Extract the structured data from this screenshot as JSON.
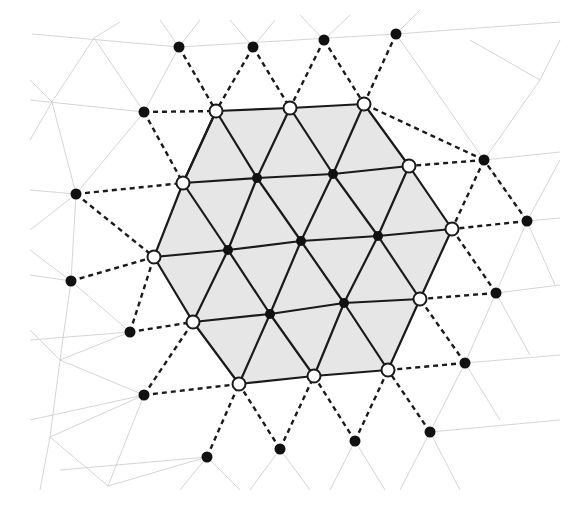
{
  "diagram": {
    "colors": {
      "background": "#ffffff",
      "patch_fill": "#e6e6e6",
      "edge": "#1a1a1a",
      "grid": "#d0d0d0"
    },
    "interior_nodes": [
      [
        257,
        178
      ],
      [
        333,
        174
      ],
      [
        228,
        250
      ],
      [
        301,
        241
      ],
      [
        378,
        236
      ],
      [
        270,
        314
      ],
      [
        344,
        303
      ]
    ],
    "boundary_nodes": [
      [
        216,
        111
      ],
      [
        290,
        108
      ],
      [
        364,
        104
      ],
      [
        409,
        166
      ],
      [
        452,
        229
      ],
      [
        420,
        299
      ],
      [
        388,
        370
      ],
      [
        314,
        376
      ],
      [
        239,
        384
      ],
      [
        193,
        322
      ],
      [
        154,
        257
      ],
      [
        183,
        183
      ]
    ],
    "outer_nodes": [
      [
        179,
        47
      ],
      [
        253,
        47
      ],
      [
        324,
        40
      ],
      [
        396,
        34
      ],
      [
        484,
        160
      ],
      [
        527,
        221
      ],
      [
        496,
        293
      ],
      [
        465,
        363
      ],
      [
        430,
        432
      ],
      [
        355,
        441
      ],
      [
        280,
        449
      ],
      [
        207,
        457
      ],
      [
        144,
        395
      ],
      [
        130,
        332
      ],
      [
        71,
        281
      ],
      [
        76,
        194
      ],
      [
        144,
        112
      ]
    ],
    "solid_edges": [
      [
        [
          216,
          111
        ],
        [
          290,
          108
        ]
      ],
      [
        [
          290,
          108
        ],
        [
          364,
          104
        ]
      ],
      [
        [
          364,
          104
        ],
        [
          409,
          166
        ]
      ],
      [
        [
          409,
          166
        ],
        [
          452,
          229
        ]
      ],
      [
        [
          452,
          229
        ],
        [
          420,
          299
        ]
      ],
      [
        [
          420,
          299
        ],
        [
          388,
          370
        ]
      ],
      [
        [
          388,
          370
        ],
        [
          314,
          376
        ]
      ],
      [
        [
          314,
          376
        ],
        [
          239,
          384
        ]
      ],
      [
        [
          239,
          384
        ],
        [
          193,
          322
        ]
      ],
      [
        [
          193,
          322
        ],
        [
          154,
          257
        ]
      ],
      [
        [
          154,
          257
        ],
        [
          183,
          183
        ]
      ],
      [
        [
          183,
          183
        ],
        [
          216,
          111
        ]
      ],
      [
        [
          183,
          183
        ],
        [
          257,
          178
        ]
      ],
      [
        [
          257,
          178
        ],
        [
          333,
          174
        ]
      ],
      [
        [
          333,
          174
        ],
        [
          409,
          166
        ]
      ],
      [
        [
          154,
          257
        ],
        [
          228,
          250
        ]
      ],
      [
        [
          228,
          250
        ],
        [
          301,
          241
        ]
      ],
      [
        [
          301,
          241
        ],
        [
          378,
          236
        ]
      ],
      [
        [
          378,
          236
        ],
        [
          452,
          229
        ]
      ],
      [
        [
          193,
          322
        ],
        [
          270,
          314
        ]
      ],
      [
        [
          270,
          314
        ],
        [
          344,
          303
        ]
      ],
      [
        [
          344,
          303
        ],
        [
          420,
          299
        ]
      ],
      [
        [
          216,
          111
        ],
        [
          257,
          178
        ]
      ],
      [
        [
          257,
          178
        ],
        [
          301,
          241
        ]
      ],
      [
        [
          301,
          241
        ],
        [
          344,
          303
        ]
      ],
      [
        [
          344,
          303
        ],
        [
          388,
          370
        ]
      ],
      [
        [
          183,
          183
        ],
        [
          228,
          250
        ]
      ],
      [
        [
          228,
          250
        ],
        [
          270,
          314
        ]
      ],
      [
        [
          270,
          314
        ],
        [
          314,
          376
        ]
      ],
      [
        [
          290,
          108
        ],
        [
          333,
          174
        ]
      ],
      [
        [
          333,
          174
        ],
        [
          378,
          236
        ]
      ],
      [
        [
          378,
          236
        ],
        [
          420,
          299
        ]
      ],
      [
        [
          290,
          108
        ],
        [
          257,
          178
        ]
      ],
      [
        [
          257,
          178
        ],
        [
          228,
          250
        ]
      ],
      [
        [
          228,
          250
        ],
        [
          193,
          322
        ]
      ],
      [
        [
          364,
          104
        ],
        [
          333,
          174
        ]
      ],
      [
        [
          333,
          174
        ],
        [
          301,
          241
        ]
      ],
      [
        [
          301,
          241
        ],
        [
          270,
          314
        ]
      ],
      [
        [
          270,
          314
        ],
        [
          239,
          384
        ]
      ],
      [
        [
          409,
          166
        ],
        [
          378,
          236
        ]
      ],
      [
        [
          378,
          236
        ],
        [
          344,
          303
        ]
      ],
      [
        [
          344,
          303
        ],
        [
          314,
          376
        ]
      ],
      [
        [
          216,
          111
        ],
        [
          183,
          183
        ]
      ]
    ],
    "dashed_edges": [
      [
        [
          179,
          47
        ],
        [
          216,
          111
        ]
      ],
      [
        [
          253,
          47
        ],
        [
          216,
          111
        ]
      ],
      [
        [
          253,
          47
        ],
        [
          290,
          108
        ]
      ],
      [
        [
          324,
          40
        ],
        [
          290,
          108
        ]
      ],
      [
        [
          324,
          40
        ],
        [
          364,
          104
        ]
      ],
      [
        [
          396,
          34
        ],
        [
          364,
          104
        ]
      ],
      [
        [
          144,
          112
        ],
        [
          216,
          111
        ]
      ],
      [
        [
          144,
          112
        ],
        [
          183,
          183
        ]
      ],
      [
        [
          76,
          194
        ],
        [
          183,
          183
        ]
      ],
      [
        [
          76,
          194
        ],
        [
          154,
          257
        ]
      ],
      [
        [
          71,
          281
        ],
        [
          154,
          257
        ]
      ],
      [
        [
          130,
          332
        ],
        [
          154,
          257
        ]
      ],
      [
        [
          130,
          332
        ],
        [
          193,
          322
        ]
      ],
      [
        [
          144,
          395
        ],
        [
          193,
          322
        ]
      ],
      [
        [
          144,
          395
        ],
        [
          239,
          384
        ]
      ],
      [
        [
          207,
          457
        ],
        [
          239,
          384
        ]
      ],
      [
        [
          280,
          449
        ],
        [
          239,
          384
        ]
      ],
      [
        [
          280,
          449
        ],
        [
          314,
          376
        ]
      ],
      [
        [
          355,
          441
        ],
        [
          314,
          376
        ]
      ],
      [
        [
          355,
          441
        ],
        [
          388,
          370
        ]
      ],
      [
        [
          430,
          432
        ],
        [
          388,
          370
        ]
      ],
      [
        [
          465,
          363
        ],
        [
          388,
          370
        ]
      ],
      [
        [
          465,
          363
        ],
        [
          420,
          299
        ]
      ],
      [
        [
          496,
          293
        ],
        [
          420,
          299
        ]
      ],
      [
        [
          496,
          293
        ],
        [
          452,
          229
        ]
      ],
      [
        [
          527,
          221
        ],
        [
          452,
          229
        ]
      ],
      [
        [
          484,
          160
        ],
        [
          452,
          229
        ]
      ],
      [
        [
          484,
          160
        ],
        [
          409,
          166
        ]
      ],
      [
        [
          484,
          160
        ],
        [
          364,
          104
        ]
      ],
      [
        [
          527,
          221
        ],
        [
          484,
          160
        ]
      ]
    ],
    "grid_lines": [
      [
        [
          32,
          34
        ],
        [
          179,
          47
        ]
      ],
      [
        [
          179,
          47
        ],
        [
          396,
          34
        ]
      ],
      [
        [
          396,
          34
        ],
        [
          560,
          22
        ]
      ],
      [
        [
          30,
          100
        ],
        [
          144,
          112
        ]
      ],
      [
        [
          484,
          160
        ],
        [
          560,
          152
        ]
      ],
      [
        [
          527,
          221
        ],
        [
          560,
          218
        ]
      ],
      [
        [
          496,
          293
        ],
        [
          560,
          285
        ]
      ],
      [
        [
          465,
          363
        ],
        [
          560,
          355
        ]
      ],
      [
        [
          430,
          432
        ],
        [
          560,
          420
        ]
      ],
      [
        [
          30,
          190
        ],
        [
          76,
          194
        ]
      ],
      [
        [
          30,
          275
        ],
        [
          71,
          281
        ]
      ],
      [
        [
          30,
          340
        ],
        [
          130,
          332
        ]
      ],
      [
        [
          30,
          420
        ],
        [
          144,
          395
        ]
      ],
      [
        [
          60,
          470
        ],
        [
          207,
          457
        ]
      ],
      [
        [
          94,
          38
        ],
        [
          52,
          102
        ]
      ],
      [
        [
          94,
          38
        ],
        [
          144,
          112
        ]
      ],
      [
        [
          94,
          38
        ],
        [
          120,
          22
        ]
      ],
      [
        [
          52,
          102
        ],
        [
          76,
          194
        ]
      ],
      [
        [
          52,
          102
        ],
        [
          30,
          80
        ]
      ],
      [
        [
          52,
          102
        ],
        [
          30,
          140
        ]
      ],
      [
        [
          76,
          194
        ],
        [
          144,
          112
        ]
      ],
      [
        [
          76,
          194
        ],
        [
          71,
          281
        ]
      ],
      [
        [
          76,
          194
        ],
        [
          30,
          230
        ]
      ],
      [
        [
          71,
          281
        ],
        [
          130,
          332
        ]
      ],
      [
        [
          71,
          281
        ],
        [
          60,
          360
        ]
      ],
      [
        [
          71,
          281
        ],
        [
          30,
          250
        ]
      ],
      [
        [
          60,
          360
        ],
        [
          130,
          332
        ]
      ],
      [
        [
          60,
          360
        ],
        [
          144,
          395
        ]
      ],
      [
        [
          60,
          360
        ],
        [
          50,
          437
        ]
      ],
      [
        [
          60,
          360
        ],
        [
          30,
          330
        ]
      ],
      [
        [
          50,
          437
        ],
        [
          144,
          395
        ]
      ],
      [
        [
          50,
          437
        ],
        [
          108,
          486
        ]
      ],
      [
        [
          50,
          437
        ],
        [
          40,
          490
        ]
      ],
      [
        [
          108,
          486
        ],
        [
          144,
          395
        ]
      ],
      [
        [
          108,
          486
        ],
        [
          207,
          457
        ]
      ],
      [
        [
          207,
          457
        ],
        [
          240,
          490
        ]
      ],
      [
        [
          207,
          457
        ],
        [
          180,
          490
        ]
      ],
      [
        [
          280,
          449
        ],
        [
          250,
          490
        ]
      ],
      [
        [
          280,
          449
        ],
        [
          310,
          490
        ]
      ],
      [
        [
          355,
          441
        ],
        [
          330,
          490
        ]
      ],
      [
        [
          355,
          441
        ],
        [
          385,
          490
        ]
      ],
      [
        [
          430,
          432
        ],
        [
          400,
          490
        ]
      ],
      [
        [
          430,
          432
        ],
        [
          460,
          490
        ]
      ],
      [
        [
          465,
          363
        ],
        [
          430,
          432
        ]
      ],
      [
        [
          465,
          363
        ],
        [
          500,
          420
        ]
      ],
      [
        [
          496,
          293
        ],
        [
          465,
          363
        ]
      ],
      [
        [
          496,
          293
        ],
        [
          530,
          355
        ]
      ],
      [
        [
          527,
          221
        ],
        [
          496,
          293
        ]
      ],
      [
        [
          527,
          221
        ],
        [
          555,
          285
        ]
      ],
      [
        [
          484,
          160
        ],
        [
          527,
          221
        ]
      ],
      [
        [
          396,
          34
        ],
        [
          484,
          160
        ]
      ],
      [
        [
          396,
          34
        ],
        [
          420,
          10
        ]
      ],
      [
        [
          324,
          40
        ],
        [
          300,
          15
        ]
      ],
      [
        [
          324,
          40
        ],
        [
          350,
          15
        ]
      ],
      [
        [
          253,
          47
        ],
        [
          230,
          20
        ]
      ],
      [
        [
          253,
          47
        ],
        [
          275,
          20
        ]
      ],
      [
        [
          179,
          47
        ],
        [
          160,
          20
        ]
      ],
      [
        [
          179,
          47
        ],
        [
          200,
          20
        ]
      ],
      [
        [
          144,
          112
        ],
        [
          179,
          47
        ]
      ],
      [
        [
          484,
          160
        ],
        [
          540,
          80
        ]
      ],
      [
        [
          540,
          80
        ],
        [
          560,
          40
        ]
      ],
      [
        [
          540,
          80
        ],
        [
          470,
          40
        ]
      ],
      [
        [
          527,
          221
        ],
        [
          560,
          160
        ]
      ]
    ]
  }
}
